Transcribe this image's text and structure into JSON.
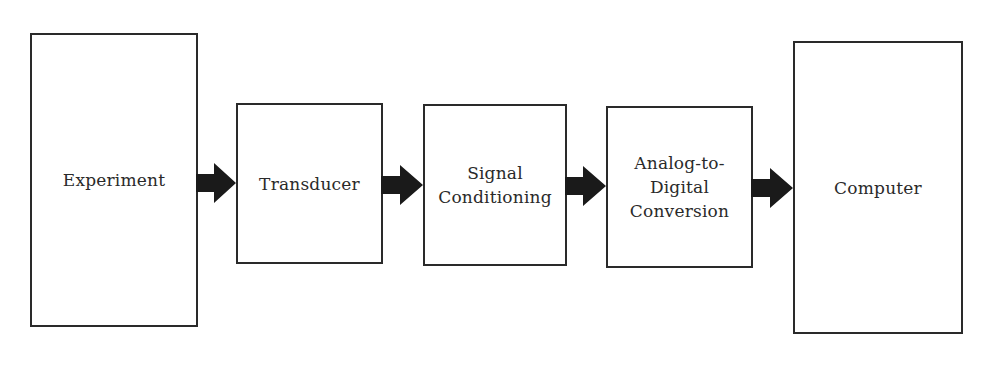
{
  "diagram": {
    "type": "block-flow",
    "direction": "left-to-right",
    "blocks": [
      {
        "id": "experiment",
        "label": "Experiment"
      },
      {
        "id": "transducer",
        "label": "Transducer"
      },
      {
        "id": "signal-conditioning",
        "label": "Signal\nConditioning"
      },
      {
        "id": "adc",
        "label": "Analog-to-\nDigital\nConversion"
      },
      {
        "id": "computer",
        "label": "Computer"
      }
    ],
    "connections": [
      {
        "from": "experiment",
        "to": "transducer",
        "icon": "right-arrow-icon"
      },
      {
        "from": "transducer",
        "to": "signal-conditioning",
        "icon": "right-arrow-icon"
      },
      {
        "from": "signal-conditioning",
        "to": "adc",
        "icon": "right-arrow-icon"
      },
      {
        "from": "adc",
        "to": "computer",
        "icon": "right-arrow-icon"
      }
    ],
    "colors": {
      "stroke": "#2a2a2a",
      "arrow_fill": "#1a1a1a",
      "background": "#ffffff"
    }
  }
}
